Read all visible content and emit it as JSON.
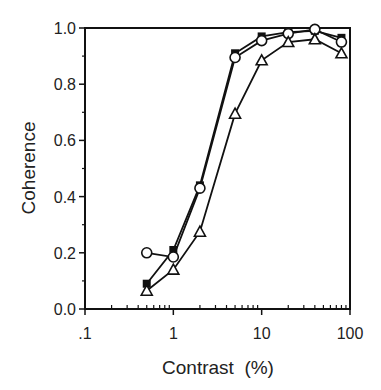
{
  "chart_data": {
    "type": "line",
    "title": "",
    "xlabel": "Contrast  (%)",
    "ylabel": "Coherence",
    "xscale": "log",
    "xlim": [
      0.1,
      100
    ],
    "ylim": [
      0.0,
      1.0
    ],
    "x_ticks": [
      {
        "value": 0.1,
        "label": ".1"
      },
      {
        "value": 1,
        "label": "1"
      },
      {
        "value": 10,
        "label": "10"
      },
      {
        "value": 100,
        "label": "100"
      }
    ],
    "y_ticks": [
      {
        "value": 0.0,
        "label": "0.0"
      },
      {
        "value": 0.2,
        "label": "0.2"
      },
      {
        "value": 0.4,
        "label": "0.4"
      },
      {
        "value": 0.6,
        "label": "0.6"
      },
      {
        "value": 0.8,
        "label": "0.8"
      },
      {
        "value": 1.0,
        "label": "1.0"
      }
    ],
    "grid": false,
    "legend": null,
    "series": [
      {
        "name": "filled-square",
        "marker": "square-filled",
        "x": [
          0.5,
          1,
          2,
          5,
          10,
          20,
          40,
          80
        ],
        "values": [
          0.09,
          0.21,
          0.44,
          0.91,
          0.97,
          0.985,
          0.99,
          0.965
        ]
      },
      {
        "name": "open-circle",
        "marker": "circle-open",
        "x": [
          0.5,
          1,
          2,
          5,
          10,
          20,
          40,
          80
        ],
        "values": [
          0.2,
          0.185,
          0.43,
          0.895,
          0.955,
          0.98,
          0.995,
          0.95
        ]
      },
      {
        "name": "open-triangle",
        "marker": "triangle-open",
        "x": [
          0.5,
          1,
          2,
          5,
          10,
          20,
          40,
          80
        ],
        "values": [
          0.065,
          0.14,
          0.275,
          0.695,
          0.885,
          0.95,
          0.96,
          0.91
        ]
      }
    ]
  },
  "layout": {
    "plot_left": 85,
    "plot_right": 350,
    "plot_top": 28,
    "plot_bottom": 309,
    "line_color": "#111111"
  }
}
